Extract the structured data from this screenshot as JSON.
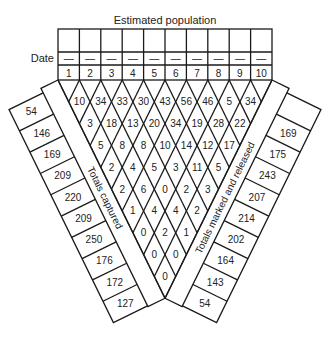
{
  "caption": "Figure",
  "header": {
    "title": "Estimated population",
    "date_label": "Date",
    "date_placeholder": "—",
    "columns": [
      "1",
      "2",
      "3",
      "4",
      "5",
      "6",
      "7",
      "8",
      "9",
      "10"
    ]
  },
  "lattice": {
    "rows": [
      [
        "10",
        "34",
        "33",
        "30",
        "43",
        "56",
        "46",
        "5",
        "34"
      ],
      [
        "3",
        "18",
        "13",
        "20",
        "34",
        "19",
        "28",
        "22"
      ],
      [
        "5",
        "8",
        "8",
        "10",
        "14",
        "12",
        "17"
      ],
      [
        "2",
        "4",
        "5",
        "3",
        "11",
        "5"
      ],
      [
        "2",
        "6",
        "0",
        "2",
        "3"
      ],
      [
        "1",
        "4",
        "4",
        "2"
      ],
      [
        "0",
        "2",
        "1"
      ],
      [
        "0",
        "0"
      ],
      [
        "0"
      ]
    ]
  },
  "left_band": {
    "label": "Totals captured",
    "values": [
      "54",
      "146",
      "169",
      "209",
      "220",
      "209",
      "250",
      "176",
      "172",
      "127"
    ]
  },
  "right_band": {
    "label": "Totals marked and released",
    "values": [
      "",
      "169",
      "175",
      "243",
      "207",
      "214",
      "202",
      "164",
      "143",
      "54"
    ]
  }
}
